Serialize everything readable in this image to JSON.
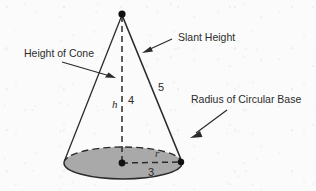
{
  "figure": {
    "type": "geometry-diagram",
    "background_color": "#fbfbfb",
    "ink_color": "#2b2b2b",
    "base_fill_color": "#a9a9a9"
  },
  "annotations": {
    "height_of_cone": "Height of Cone",
    "slant_height": "Slant Height",
    "radius_of_circular_base": "Radius of Circular Base"
  },
  "measurements": {
    "height_variable": "h",
    "height_value": "4",
    "slant_value": "5",
    "radius_variable": "r",
    "radius_value": "3"
  },
  "geometry": {
    "apex": {
      "x": 122,
      "y": 14
    },
    "base_center": {
      "x": 122,
      "y": 163
    },
    "base_right": {
      "x": 181,
      "y": 162
    },
    "base_left": {
      "x": 64,
      "y": 162
    },
    "ellipse": {
      "cx": 123,
      "cy": 163,
      "rx": 59,
      "ry": 16
    }
  }
}
